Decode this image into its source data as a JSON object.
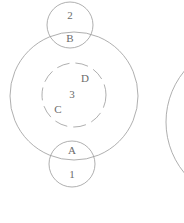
{
  "diagram": {
    "type": "venn-nested-circles",
    "background_color": "#ffffff",
    "stroke_color": "#9a9a9a",
    "text_color": "#6b6b6b",
    "labels": {
      "outer_top_above": "2",
      "outer_top_below": "B",
      "outer_bottom_above": "A",
      "outer_bottom_below": "1",
      "inner_upper_right": "D",
      "inner_center": "3",
      "inner_lower_left": "C"
    },
    "shapes": {
      "big_circle": {
        "cx": 74,
        "cy": 96,
        "r": 64,
        "dashed": false
      },
      "dashed_circle": {
        "cx": 74,
        "cy": 95,
        "r": 32,
        "dashed": true
      },
      "top_small_circle": {
        "cx": 70,
        "cy": 25,
        "r": 23,
        "dashed": false
      },
      "bottom_small_circle": {
        "cx": 72,
        "cy": 164,
        "r": 23,
        "dashed": false
      },
      "right_partial_circle": {
        "cx": 246,
        "cy": 122,
        "r": 80,
        "dashed": false
      }
    }
  }
}
